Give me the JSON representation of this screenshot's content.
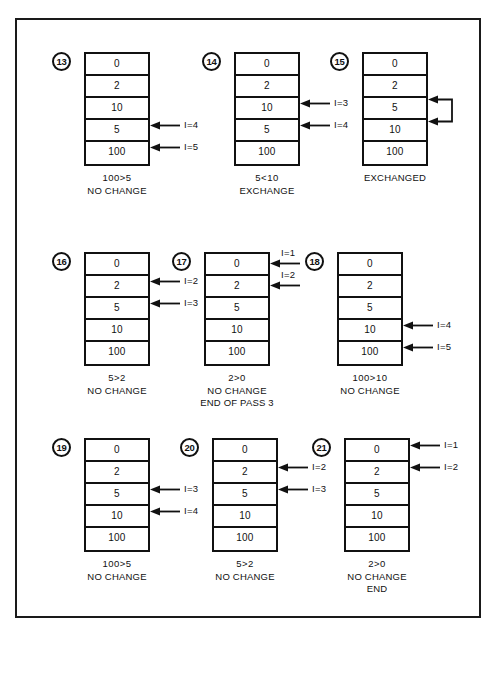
{
  "figure": {
    "array_values": [
      "0",
      "2",
      "10",
      "5",
      "100"
    ],
    "panels": [
      {
        "id": "panel-13",
        "step": "13",
        "cells": [
          "0",
          "2",
          "10",
          "5",
          "100"
        ],
        "caption": [
          "100>5",
          "NO CHANGE"
        ],
        "pointers": [
          {
            "row": 4,
            "label": "I=4"
          },
          {
            "row": 5,
            "label": "I=5"
          }
        ]
      },
      {
        "id": "panel-14",
        "step": "14",
        "cells": [
          "0",
          "2",
          "10",
          "5",
          "100"
        ],
        "caption": [
          "5<10",
          "EXCHANGE"
        ],
        "pointers": [
          {
            "row": 3,
            "label": "I=3"
          },
          {
            "row": 4,
            "label": "I=4"
          }
        ]
      },
      {
        "id": "panel-15",
        "step": "15",
        "cells": [
          "0",
          "2",
          "5",
          "10",
          "100"
        ],
        "caption": [
          "EXCHANGED"
        ],
        "pointers": [],
        "exchange_rows": [
          3,
          4
        ]
      },
      {
        "id": "panel-16",
        "step": "16",
        "cells": [
          "0",
          "2",
          "5",
          "10",
          "100"
        ],
        "caption": [
          "5>2",
          "NO CHANGE"
        ],
        "pointers": [
          {
            "row": 2,
            "label": "I=2"
          },
          {
            "row": 3,
            "label": "I=3"
          }
        ]
      },
      {
        "id": "panel-17",
        "step": "17",
        "cells": [
          "0",
          "2",
          "5",
          "10",
          "100"
        ],
        "caption": [
          "2>0",
          "NO CHANGE",
          "END OF PASS 3"
        ],
        "pointers_above": [
          {
            "row": 1,
            "label": "I=1"
          },
          {
            "row": 2,
            "label": "I=2"
          }
        ]
      },
      {
        "id": "panel-18",
        "step": "18",
        "cells": [
          "0",
          "2",
          "5",
          "10",
          "100"
        ],
        "caption": [
          "100>10",
          "NO CHANGE"
        ],
        "pointers": [
          {
            "row": 4,
            "label": "I=4"
          },
          {
            "row": 5,
            "label": "I=5"
          }
        ]
      },
      {
        "id": "panel-19",
        "step": "19",
        "cells": [
          "0",
          "2",
          "5",
          "10",
          "100"
        ],
        "caption": [
          "100>5",
          "NO CHANGE"
        ],
        "pointers": [
          {
            "row": 3,
            "label": "I=3"
          },
          {
            "row": 4,
            "label": "I=4"
          }
        ]
      },
      {
        "id": "panel-20",
        "step": "20",
        "cells": [
          "0",
          "2",
          "5",
          "10",
          "100"
        ],
        "caption": [
          "5>2",
          "NO CHANGE"
        ],
        "pointers": [
          {
            "row": 2,
            "label": "I=2"
          },
          {
            "row": 3,
            "label": "I=3"
          }
        ]
      },
      {
        "id": "panel-21",
        "step": "21",
        "cells": [
          "0",
          "2",
          "5",
          "10",
          "100"
        ],
        "caption": [
          "2>0",
          "NO CHANGE",
          "END"
        ],
        "pointers": [
          {
            "row": 1,
            "label": "I=1"
          },
          {
            "row": 2,
            "label": "I=2"
          }
        ]
      }
    ]
  },
  "colors": {
    "ink": "#111111",
    "frame": "#1a1a1a",
    "paper": "#ffffff"
  }
}
